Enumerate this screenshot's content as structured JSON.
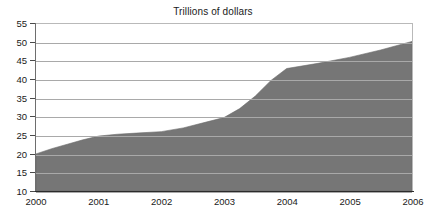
{
  "chart_data": {
    "type": "area",
    "title": "Trillions of dollars",
    "xlabel": "",
    "ylabel": "",
    "grid": true,
    "legend": false,
    "xlim": [
      2000,
      2006
    ],
    "ylim": [
      10,
      55
    ],
    "ytick_step": 5,
    "categories": [
      "2000",
      "2001",
      "2002",
      "2003",
      "2004",
      "2005",
      "2006"
    ],
    "yticks": [
      "10",
      "15",
      "20",
      "25",
      "30",
      "35",
      "40",
      "45",
      "50",
      "55"
    ],
    "series": [
      {
        "name": "Trillions of dollars",
        "color": "#767676",
        "values": [
          20.0,
          24.8,
          26.0,
          29.8,
          43.0,
          46.0,
          50.3
        ]
      }
    ],
    "x": [
      2000,
      2001,
      2002,
      2003,
      2004,
      2005,
      2006
    ],
    "dense_points": [
      {
        "x": 2000.0,
        "y": 20.0
      },
      {
        "x": 2000.25,
        "y": 21.4
      },
      {
        "x": 2000.5,
        "y": 22.6
      },
      {
        "x": 2000.75,
        "y": 23.8
      },
      {
        "x": 2001.0,
        "y": 24.8
      },
      {
        "x": 2001.3,
        "y": 25.3
      },
      {
        "x": 2001.6,
        "y": 25.6
      },
      {
        "x": 2002.0,
        "y": 26.0
      },
      {
        "x": 2002.35,
        "y": 27.0
      },
      {
        "x": 2002.7,
        "y": 28.5
      },
      {
        "x": 2003.0,
        "y": 29.8
      },
      {
        "x": 2003.25,
        "y": 32.2
      },
      {
        "x": 2003.5,
        "y": 35.6
      },
      {
        "x": 2003.75,
        "y": 39.8
      },
      {
        "x": 2004.0,
        "y": 43.0
      },
      {
        "x": 2004.5,
        "y": 44.4
      },
      {
        "x": 2005.0,
        "y": 46.0
      },
      {
        "x": 2005.5,
        "y": 48.0
      },
      {
        "x": 2006.0,
        "y": 50.3
      }
    ]
  },
  "axis_colors": {
    "gridline": "#a9a9a9",
    "axis": "#2b2b2b",
    "text": "#1a1a1a",
    "area_fill": "#767676",
    "plot_border": "#b9b9b9"
  }
}
